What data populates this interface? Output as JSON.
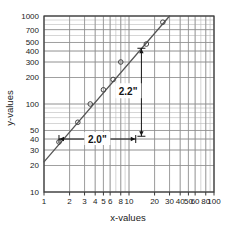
{
  "chart_data": {
    "type": "scatter",
    "title": "",
    "xlabel": "x-values",
    "ylabel": "y-values",
    "xscale": "log",
    "yscale": "log",
    "xlim": [
      1,
      100
    ],
    "ylim": [
      10,
      1000
    ],
    "grid": true,
    "legend": false,
    "x_tick_labels": [
      "1",
      "2",
      "3",
      "4",
      "5",
      "6",
      "8",
      "10",
      "20",
      "30",
      "40",
      "50",
      "60",
      "80",
      "100"
    ],
    "x_ticks": [
      1,
      2,
      3,
      4,
      5,
      6,
      8,
      10,
      20,
      30,
      40,
      50,
      60,
      80,
      100
    ],
    "y_tick_labels": [
      "10",
      "20",
      "30",
      "40",
      "50",
      "100",
      "200",
      "300",
      "400",
      "500",
      "700",
      "1000"
    ],
    "y_ticks": [
      10,
      20,
      30,
      40,
      50,
      100,
      200,
      300,
      400,
      500,
      700,
      1000
    ],
    "series": [
      {
        "name": "data",
        "marker": "open-circle",
        "x": [
          1.5,
          2.5,
          3.5,
          5.0,
          6.5,
          8.0,
          16.0,
          25.0
        ],
        "y": [
          37,
          62,
          100,
          145,
          190,
          300,
          480,
          850
        ]
      },
      {
        "name": "fit-line",
        "marker": "none",
        "x": [
          1.0,
          30.0
        ],
        "y": [
          22,
          1000
        ]
      }
    ],
    "annotations": [
      {
        "name": "horizontal-span",
        "label": "2.0\"",
        "orientation": "horizontal",
        "x_from": 1.5,
        "x_to": 12.0,
        "y": 40
      },
      {
        "name": "vertical-span",
        "label": "2.2\"",
        "orientation": "vertical",
        "x": 14.0,
        "y_from": 43,
        "y_to": 430
      }
    ],
    "colors": {
      "grid": "#b9b9b9",
      "axis": "#3a3a3a",
      "line": "#555555",
      "marker": "#444444",
      "text": "#1a1a1a",
      "background": "#ffffff"
    }
  }
}
